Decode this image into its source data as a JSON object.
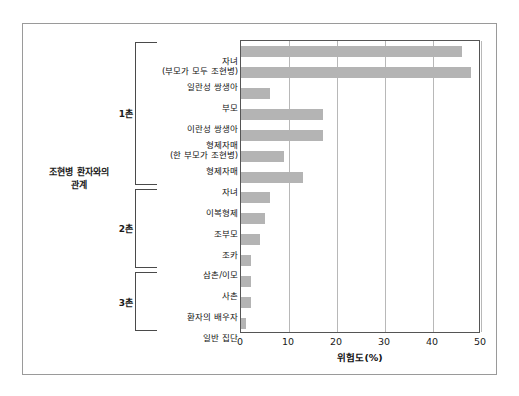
{
  "figure": {
    "y_axis_title": "조현병 환자와의\n관계",
    "x_axis_title": "위험도(%)"
  },
  "groups": [
    {
      "label": "1촌",
      "first": 0,
      "last": 6
    },
    {
      "label": "2촌",
      "first": 7,
      "last": 10
    },
    {
      "label": "3촌",
      "first": 11,
      "last": 13
    }
  ],
  "axis": {
    "ticks": [
      0,
      10,
      20,
      30,
      40,
      50
    ],
    "tick_labels": [
      "0",
      "10",
      "20",
      "30",
      "40",
      "50"
    ],
    "min": 0,
    "max": 50
  },
  "chart_data": {
    "type": "bar",
    "orientation": "horizontal",
    "title": "",
    "xlabel": "위험도(%)",
    "ylabel": "조현병 환자와의 관계",
    "xlim": [
      0,
      50
    ],
    "grid": true,
    "legend": false,
    "bar_color": "#b4b4b4",
    "categories": [
      "자녀\n(부모가 모두 조현병)",
      "일란성 쌍생아",
      "부모",
      "이란성 쌍생아",
      "형제자매\n(한 부모가 조현병)",
      "형제자매",
      "자녀",
      "이복형제",
      "조부모",
      "조카",
      "삼촌/이모",
      "사촌",
      "환자의 배우자",
      "일반 집단"
    ],
    "values": [
      46,
      48,
      6,
      17,
      17,
      9,
      13,
      6,
      5,
      4,
      2,
      2,
      2,
      1
    ]
  }
}
